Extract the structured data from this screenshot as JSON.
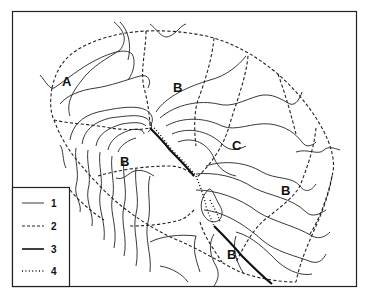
{
  "diagram": {
    "type": "catchment-sketch-map",
    "region_labels": [
      {
        "id": "A",
        "text": "A",
        "x": 67,
        "y": 82
      },
      {
        "id": "B1",
        "text": "B",
        "x": 178,
        "y": 90
      },
      {
        "id": "C",
        "text": "C",
        "x": 237,
        "y": 147
      },
      {
        "id": "B2",
        "text": "B",
        "x": 124,
        "y": 163
      },
      {
        "id": "B3",
        "text": "B",
        "x": 285,
        "y": 192
      },
      {
        "id": "B4",
        "text": "B",
        "x": 231,
        "y": 256
      }
    ],
    "legend": {
      "items": [
        {
          "symbol": "thin-solid-line",
          "label": "1"
        },
        {
          "symbol": "dashed-line",
          "label": "2"
        },
        {
          "symbol": "thick-solid-line",
          "label": "3"
        },
        {
          "symbol": "dotted-line",
          "label": "4"
        }
      ]
    }
  }
}
